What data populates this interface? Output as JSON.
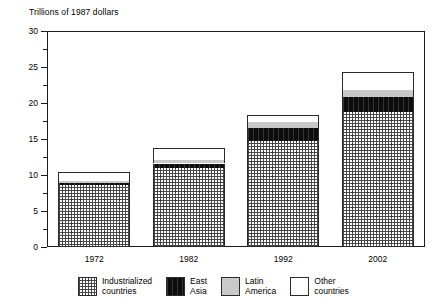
{
  "chart_data": {
    "type": "bar",
    "subtype": "stacked-bar",
    "title": "Trillions of 1987 dollars",
    "xlabel": "",
    "ylabel": "",
    "ylim": [
      0,
      30
    ],
    "ytick_step": 5,
    "yticks": [
      "0",
      "5",
      "10",
      "15",
      "20",
      "25",
      "30"
    ],
    "minor_tick_step": 2.5,
    "grid": false,
    "legend_position": "bottom",
    "categories": [
      "1972",
      "1982",
      "1992",
      "2002"
    ],
    "series": [
      {
        "name": "Industrialized countries",
        "label_line1": "Industrialized",
        "label_line2": "countries",
        "pattern": "cross-hatch",
        "color": "#c9c9c9",
        "values": [
          8.6,
          11.0,
          14.7,
          18.8
        ]
      },
      {
        "name": "East Asia",
        "label_line1": "East",
        "label_line2": "Asia",
        "pattern": "solid-black",
        "color": "#0d0d0d",
        "values": [
          0.35,
          0.6,
          1.8,
          2.0
        ]
      },
      {
        "name": "Latin America",
        "label_line1": "Latin",
        "label_line2": "America",
        "pattern": "solid-gray",
        "color": "#c9c9c9",
        "values": [
          0.25,
          0.5,
          0.8,
          1.0
        ]
      },
      {
        "name": "Other countries",
        "label_line1": "Other",
        "label_line2": "countries",
        "pattern": "solid-white",
        "color": "#ffffff",
        "values": [
          1.2,
          1.6,
          1.0,
          2.5
        ]
      }
    ],
    "totals": [
      10.4,
      13.7,
      18.3,
      24.3
    ]
  }
}
